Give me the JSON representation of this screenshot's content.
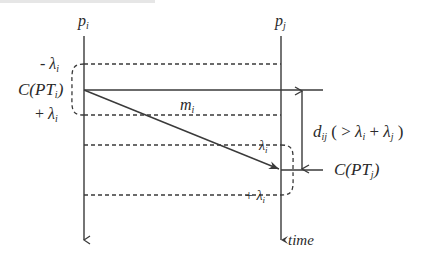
{
  "diagram": {
    "title_fragment": "",
    "processes": [
      {
        "id": "pi",
        "label": "p",
        "sub": "i"
      },
      {
        "id": "pj",
        "label": "p",
        "sub": "j"
      }
    ],
    "time_axis_label": "time",
    "left_labels": {
      "minus_lambda": {
        "prefix": "- ",
        "symbol": "λ",
        "sub": "i"
      },
      "checkpoint": {
        "prefix": "C(PT",
        "sub": "i",
        "suffix": ")"
      },
      "plus_lambda": {
        "prefix": "+ ",
        "symbol": "λ",
        "sub": "i"
      }
    },
    "message": {
      "label": "m",
      "sub": "i"
    },
    "right_labels": {
      "lambda_upper": {
        "symbol": "λ",
        "sub": "i"
      },
      "lambda_lower": {
        "prefix": "+ ",
        "symbol": "λ",
        "sub": "i"
      },
      "checkpoint": {
        "prefix": "C(PT",
        "sub": "j",
        "suffix": ")"
      }
    },
    "distance": {
      "label": "d",
      "sub": "ij",
      "condition_open": " ( > ",
      "lambda_i": "λ",
      "lambda_i_sub": "i",
      "plus": " + ",
      "lambda_j": "λ",
      "lambda_j_sub": "j",
      "condition_close": " )"
    },
    "colors": {
      "stroke": "#3a3a3a",
      "text": "#2a2a2a",
      "background": "#ffffff"
    }
  }
}
